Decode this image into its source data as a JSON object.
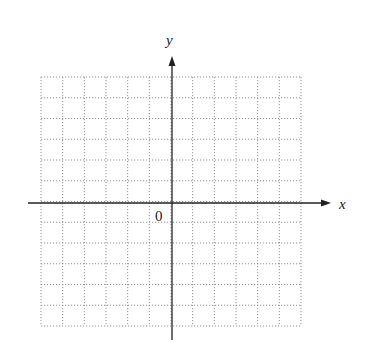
{
  "diagram": {
    "type": "coordinate-grid",
    "axes": {
      "x_label": "x",
      "y_label": "y",
      "origin_label": "0"
    },
    "grid": {
      "columns": 12,
      "rows": 12,
      "x_min": -6,
      "x_max": 6,
      "y_min": -6,
      "y_max": 6,
      "line_style": "dotted",
      "line_color": "#8a8a8a"
    },
    "axis_color": "#222222"
  }
}
